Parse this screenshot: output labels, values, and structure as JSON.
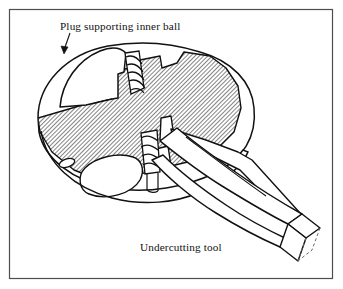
{
  "figure": {
    "type": "technical-cross-section-illustration",
    "background_color": "#ffffff",
    "line_color": "#111111",
    "hatch_color": "#3a3a3a",
    "border": {
      "color": "#4d4d4d",
      "x": 9,
      "y": 9,
      "width": 324,
      "height": 270,
      "stroke_width": 1.2
    },
    "labels": {
      "top": "Plug supporting inner ball",
      "bottom": "Undercutting tool"
    },
    "leader": {
      "name": "arrow-to-plug",
      "from_x": 70,
      "from_y": 33,
      "to_x": 63,
      "to_y": 53
    },
    "parts": [
      {
        "name": "valve-body-sphere",
        "section": "hatched"
      },
      {
        "name": "plug-supporting-inner-ball",
        "section": "plain"
      },
      {
        "name": "upper-threaded-stem",
        "section": "threaded"
      },
      {
        "name": "lower-threaded-stem",
        "section": "threaded"
      },
      {
        "name": "undercutting-tool-shaft",
        "section": "plain"
      },
      {
        "name": "undercutting-tool-blade-end",
        "section": "plain"
      },
      {
        "name": "lower-cavity",
        "section": "plain"
      },
      {
        "name": "small-port-slot",
        "section": "plain"
      }
    ]
  }
}
